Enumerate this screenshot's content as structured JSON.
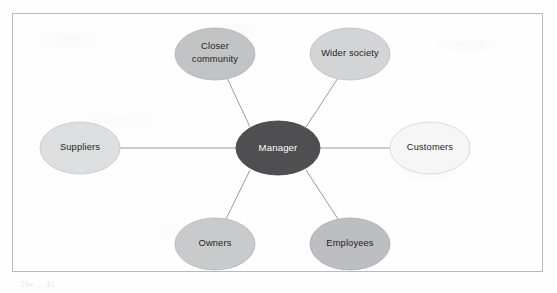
{
  "figure": {
    "type": "hub-and-spoke stakeholder map",
    "frame": {
      "border_color": "#b9babc"
    },
    "background_color": "#fefefe",
    "caption_partial": "The  ...  ibl"
  },
  "diagram": {
    "center": {
      "id": "manager",
      "label": "Manager",
      "fill": "#4f4e51",
      "stroke": "#3f3e41",
      "text_color": "#ffffff",
      "cx": 266,
      "cy": 135,
      "rx": 42,
      "ry": 27
    },
    "connector": {
      "color": "#8d8e92",
      "width": 0.9
    },
    "nodes": [
      {
        "id": "closer-community",
        "label_lines": [
          "Closer",
          "community"
        ],
        "label": "Closer community",
        "fill": "#c2c3c5",
        "stroke": "#b0b1b4",
        "cx": 203,
        "cy": 41,
        "rx": 40,
        "ry": 26
      },
      {
        "id": "wider-society",
        "label_lines": [
          "Wider society"
        ],
        "label": "Wider society",
        "fill": "#d3d4d6",
        "stroke": "#bcbdc0",
        "cx": 338,
        "cy": 41,
        "rx": 40,
        "ry": 26
      },
      {
        "id": "suppliers",
        "label_lines": [
          "Suppliers"
        ],
        "label": "Suppliers",
        "fill": "#dddee0",
        "stroke": "#c6c7ca",
        "cx": 68,
        "cy": 135,
        "rx": 40,
        "ry": 26
      },
      {
        "id": "customers",
        "label_lines": [
          "Customers"
        ],
        "label": "Customers",
        "fill": "#f6f6f7",
        "stroke": "#d2d3d6",
        "cx": 418,
        "cy": 135,
        "rx": 40,
        "ry": 26
      },
      {
        "id": "owners",
        "label_lines": [
          "Owners"
        ],
        "label": "Owners",
        "fill": "#c9cacc",
        "stroke": "#b4b5b8",
        "cx": 203,
        "cy": 231,
        "rx": 40,
        "ry": 26
      },
      {
        "id": "employees",
        "label_lines": [
          "Employees"
        ],
        "label": "Employees",
        "fill": "#bdbec1",
        "stroke": "#aaabae",
        "cx": 338,
        "cy": 231,
        "rx": 40,
        "ry": 26
      }
    ],
    "edges": [
      {
        "from": "manager",
        "to": "closer-community"
      },
      {
        "from": "manager",
        "to": "wider-society"
      },
      {
        "from": "manager",
        "to": "suppliers"
      },
      {
        "from": "manager",
        "to": "customers"
      },
      {
        "from": "manager",
        "to": "owners"
      },
      {
        "from": "manager",
        "to": "employees"
      }
    ]
  }
}
